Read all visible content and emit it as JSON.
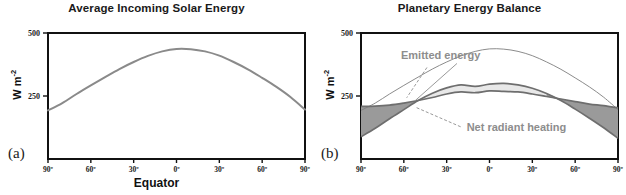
{
  "figure": {
    "width": 626,
    "height": 195,
    "background": "#ffffff"
  },
  "panels": [
    {
      "letter": "(a)",
      "title": "Average Incoming Solar Energy",
      "ylabel_main": "W m",
      "ylabel_exp": "-2",
      "xaxis_caption": "Equator",
      "show_xaxis_caption": true
    },
    {
      "letter": "(b)",
      "title": "Planetary Energy Balance",
      "ylabel_main": "W m",
      "ylabel_exp": "-2",
      "xaxis_caption": "",
      "show_xaxis_caption": false
    }
  ],
  "colors": {
    "axis": "#111111",
    "solar_curve": "#8a8a8a",
    "emitted_curve": "#6e6e6e",
    "band_light": "#e8e8e8",
    "band_dark": "#9a9a9a",
    "annotation_text": "#8d8d8d",
    "annotation_leader": "#8d8d8d",
    "title_text": "#1a1a1a",
    "tick_text": "#1a1a1a"
  },
  "chart_data": [
    {
      "type": "line",
      "panel": "a",
      "title": "Average Incoming Solar Energy",
      "xlabel": "Equator",
      "ylabel": "W m-2",
      "xlim": [
        -90,
        90
      ],
      "ylim": [
        0,
        500
      ],
      "grid": false,
      "legend": "none",
      "xticks": [
        -90,
        -60,
        -30,
        0,
        30,
        60,
        90
      ],
      "xticklabels": [
        "90º",
        "60º",
        "30º",
        "0º",
        "30º",
        "60º",
        "90º"
      ],
      "yticks": [
        250,
        500
      ],
      "yticklabels": [
        "250",
        "500"
      ],
      "series": [
        {
          "name": "Average incoming solar energy",
          "x": [
            -90,
            -80,
            -70,
            -60,
            -50,
            -40,
            -30,
            -20,
            -10,
            0,
            10,
            20,
            30,
            40,
            50,
            60,
            70,
            80,
            90
          ],
          "values": [
            193,
            222,
            258,
            292,
            325,
            357,
            385,
            409,
            427,
            437,
            436,
            427,
            410,
            385,
            356,
            322,
            286,
            245,
            196
          ]
        }
      ]
    },
    {
      "type": "area",
      "panel": "b",
      "title": "Planetary Energy Balance",
      "xlabel": "",
      "ylabel": "W m-2",
      "xlim": [
        -90,
        90
      ],
      "ylim": [
        0,
        500
      ],
      "grid": false,
      "legend": "inline annotations",
      "xticks": [
        -90,
        -60,
        -30,
        0,
        30,
        60,
        90
      ],
      "xticklabels": [
        "90º",
        "60º",
        "30º",
        "0º",
        "30º",
        "60º",
        "90º"
      ],
      "yticks": [
        250,
        500
      ],
      "yticklabels": [
        "250",
        "500"
      ],
      "series": [
        {
          "name": "Absorbed solar energy",
          "x": [
            -90,
            -80,
            -70,
            -60,
            -50,
            -40,
            -30,
            -20,
            -10,
            0,
            10,
            20,
            30,
            40,
            50,
            60,
            70,
            80,
            90
          ],
          "values": [
            88,
            122,
            160,
            196,
            232,
            261,
            282,
            294,
            288,
            297,
            300,
            294,
            281,
            260,
            232,
            198,
            162,
            124,
            82
          ]
        },
        {
          "name": "Emitted energy",
          "x": [
            -90,
            -80,
            -70,
            -60,
            -50,
            -40,
            -30,
            -20,
            -10,
            0,
            10,
            20,
            30,
            40,
            50,
            60,
            70,
            80,
            90
          ],
          "values": [
            209,
            210,
            214,
            222,
            232,
            244,
            258,
            266,
            263,
            270,
            268,
            266,
            258,
            248,
            238,
            228,
            218,
            212,
            203
          ]
        },
        {
          "name": "Incoming solar energy (top of atmosphere)",
          "x": [
            -90,
            -80,
            -70,
            -60,
            -50,
            -40,
            -30,
            -20,
            -10,
            0,
            10,
            20,
            30,
            40,
            50,
            60,
            70,
            80,
            90
          ],
          "values": [
            193,
            222,
            258,
            292,
            325,
            357,
            385,
            409,
            427,
            437,
            436,
            427,
            410,
            385,
            356,
            322,
            286,
            245,
            196
          ]
        }
      ],
      "annotations": [
        {
          "id": "emitted-energy",
          "text": "Emitted energy",
          "x": -62,
          "y": 395
        },
        {
          "id": "net-radiant-heating",
          "text": "Net radiant heating",
          "x": -16,
          "y": 112
        }
      ],
      "regions": [
        {
          "id": "net-radiant-heating-surplus",
          "fill": "#e8e8e8",
          "description": "Light shaded band between absorbed solar and emitted energy in the tropics"
        },
        {
          "id": "net-radiant-heating-deficit",
          "fill": "#9a9a9a",
          "description": "Dark shaded wedges near the poles where emitted energy exceeds absorbed solar"
        }
      ]
    }
  ]
}
